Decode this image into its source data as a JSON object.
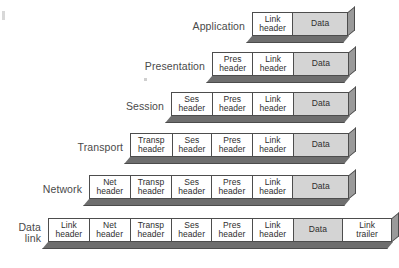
{
  "figure": {
    "type": "diagram",
    "colors": {
      "header_cell": "#ffffff",
      "payload_cell": "#d4d4d4",
      "outline": "#4d4d4d",
      "shadow_bottom": "#6e6e6e",
      "shadow_right": "#9a9a9a",
      "label_text": "#4a4a4a"
    }
  },
  "layers": [
    {
      "label": "Application",
      "left": 252,
      "top": 12,
      "cells": [
        {
          "text": "Link\nheader",
          "width": 41,
          "kind": "header"
        },
        {
          "text": "Data",
          "width": 55,
          "kind": "payload"
        }
      ]
    },
    {
      "label": "Presentation",
      "left": 212,
      "top": 52,
      "cells": [
        {
          "text": "Pres\nheader",
          "width": 41,
          "kind": "header"
        },
        {
          "text": "Link\nheader",
          "width": 41,
          "kind": "header"
        },
        {
          "text": "Data",
          "width": 55,
          "kind": "payload"
        }
      ]
    },
    {
      "label": "Session",
      "left": 171,
      "top": 92,
      "cells": [
        {
          "text": "Ses\nheader",
          "width": 41,
          "kind": "header"
        },
        {
          "text": "Pres\nheader",
          "width": 41,
          "kind": "header"
        },
        {
          "text": "Link\nheader",
          "width": 41,
          "kind": "header"
        },
        {
          "text": "Data",
          "width": 55,
          "kind": "payload"
        }
      ]
    },
    {
      "label": "Transport",
      "left": 130,
      "top": 133,
      "cells": [
        {
          "text": "Transp\nheader",
          "width": 42,
          "kind": "header"
        },
        {
          "text": "Ses\nheader",
          "width": 40,
          "kind": "header"
        },
        {
          "text": "Pres\nheader",
          "width": 41,
          "kind": "header"
        },
        {
          "text": "Link\nheader",
          "width": 41,
          "kind": "header"
        },
        {
          "text": "Data",
          "width": 55,
          "kind": "payload"
        }
      ]
    },
    {
      "label": "Network",
      "left": 89,
      "top": 175,
      "cells": [
        {
          "text": "Net\nheader",
          "width": 41,
          "kind": "header"
        },
        {
          "text": "Transp\nheader",
          "width": 42,
          "kind": "header"
        },
        {
          "text": "Ses\nheader",
          "width": 40,
          "kind": "header"
        },
        {
          "text": "Pres\nheader",
          "width": 41,
          "kind": "header"
        },
        {
          "text": "Link\nheader",
          "width": 41,
          "kind": "header"
        },
        {
          "text": "Data",
          "width": 55,
          "kind": "payload"
        }
      ]
    },
    {
      "label": "Data\nlink",
      "left": 48,
      "top": 218,
      "cells": [
        {
          "text": "Link\nheader",
          "width": 41,
          "kind": "header"
        },
        {
          "text": "Net\nheader",
          "width": 41,
          "kind": "header"
        },
        {
          "text": "Transp\nheader",
          "width": 42,
          "kind": "header"
        },
        {
          "text": "Ses\nheader",
          "width": 40,
          "kind": "header"
        },
        {
          "text": "Pres\nheader",
          "width": 41,
          "kind": "header"
        },
        {
          "text": "Link\nheader",
          "width": 41,
          "kind": "header"
        },
        {
          "text": "Data",
          "width": 50,
          "kind": "payload"
        },
        {
          "text": "Link\ntrailer",
          "width": 48,
          "kind": "trailer"
        }
      ]
    }
  ]
}
